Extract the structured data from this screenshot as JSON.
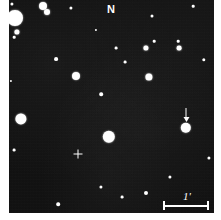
{
  "figure": {
    "type": "astronomical-finding-chart",
    "background_color": "#0e0e0e",
    "star_color": "#ffffff",
    "field": {
      "x": 9,
      "y": 0,
      "width": 205,
      "height": 213
    }
  },
  "annotations": {
    "north_label": "N",
    "north_position": {
      "x": 111,
      "y": 9
    },
    "scale_label": "1'",
    "scale_bar": {
      "x": 163,
      "y": 201,
      "width": 46
    },
    "scale_label_position": {
      "x": 187,
      "y": 196
    },
    "center_cross_position": {
      "x": 78,
      "y": 154
    },
    "target_arrow_position": {
      "x": 186,
      "y": 108
    }
  },
  "chart_data": {
    "type": "scatter",
    "title": "",
    "xlabel": "",
    "ylabel": "",
    "grid": false,
    "legend": null,
    "axis_note": "sky image, no axes; scale bar = 1 arcminute",
    "stars": [
      {
        "x": 15,
        "y": 18,
        "r": 8.0
      },
      {
        "x": 12,
        "y": 4,
        "r": 1.6
      },
      {
        "x": 43,
        "y": 6,
        "r": 4.0
      },
      {
        "x": 47,
        "y": 12,
        "r": 3.0
      },
      {
        "x": 17,
        "y": 32,
        "r": 2.6
      },
      {
        "x": 14,
        "y": 37,
        "r": 1.3
      },
      {
        "x": 71,
        "y": 8,
        "r": 1.6
      },
      {
        "x": 152,
        "y": 16,
        "r": 1.5
      },
      {
        "x": 154,
        "y": 41,
        "r": 1.3
      },
      {
        "x": 178,
        "y": 41,
        "r": 1.3
      },
      {
        "x": 116,
        "y": 48,
        "r": 1.4
      },
      {
        "x": 146,
        "y": 48,
        "r": 2.6
      },
      {
        "x": 179,
        "y": 48,
        "r": 2.4
      },
      {
        "x": 56,
        "y": 59,
        "r": 1.9
      },
      {
        "x": 125,
        "y": 62,
        "r": 1.4
      },
      {
        "x": 204,
        "y": 60,
        "r": 1.7
      },
      {
        "x": 76,
        "y": 76,
        "r": 4.0
      },
      {
        "x": 149,
        "y": 77,
        "r": 3.6
      },
      {
        "x": 101,
        "y": 94,
        "r": 1.8
      },
      {
        "x": 21,
        "y": 119,
        "r": 5.6
      },
      {
        "x": 186,
        "y": 128,
        "r": 5.2
      },
      {
        "x": 109,
        "y": 137,
        "r": 6.2
      },
      {
        "x": 14,
        "y": 150,
        "r": 1.4
      },
      {
        "x": 209,
        "y": 158,
        "r": 1.6
      },
      {
        "x": 170,
        "y": 177,
        "r": 1.6
      },
      {
        "x": 101,
        "y": 187,
        "r": 1.6
      },
      {
        "x": 146,
        "y": 193,
        "r": 2.0
      },
      {
        "x": 122,
        "y": 197,
        "r": 1.4
      },
      {
        "x": 58,
        "y": 204,
        "r": 1.8
      },
      {
        "x": 11,
        "y": 81,
        "r": 1.1
      },
      {
        "x": 96,
        "y": 30,
        "r": 1.1
      },
      {
        "x": 193,
        "y": 6,
        "r": 1.3
      }
    ]
  }
}
